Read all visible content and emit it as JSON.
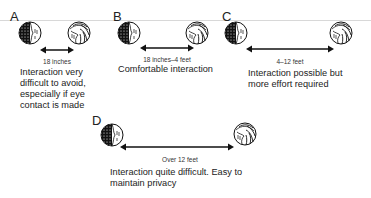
{
  "panels": [
    {
      "letter": "A",
      "distance": "18 inches",
      "description": "Interaction very difficult to avoid, especially if eye contact is made"
    },
    {
      "letter": "B",
      "distance": "18 inches–4 feet",
      "description": "Comfortable interaction"
    },
    {
      "letter": "C",
      "distance": "4–12 feet",
      "description": "Interaction possible but more effort required"
    },
    {
      "letter": "D",
      "distance": "Over 12 feet",
      "description": "Interaction quite difficult. Easy to maintain privacy"
    }
  ],
  "icons": {
    "left_head": "head-facing-right-icon",
    "right_head": "head-facing-left-icon",
    "arrow": "double-arrow-icon"
  },
  "colors": {
    "ink": "#222222",
    "rule": "#d8d8d8"
  }
}
